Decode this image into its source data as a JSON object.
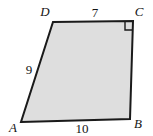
{
  "figure": {
    "type": "geometry-quadrilateral",
    "background_color": "#ffffff",
    "fill_color": "#dedede",
    "stroke_color": "#1a1a1a",
    "stroke_width": 2,
    "vertices": [
      {
        "name": "A",
        "label": "A",
        "x": 21,
        "y": 122,
        "label_x": 13,
        "label_y": 132
      },
      {
        "name": "B",
        "label": "B",
        "x": 130,
        "y": 119,
        "label_x": 138,
        "label_y": 128
      },
      {
        "name": "C",
        "label": "C",
        "x": 133,
        "y": 21,
        "label_x": 139,
        "label_y": 16
      },
      {
        "name": "D",
        "label": "D",
        "x": 53,
        "y": 22,
        "label_x": 45,
        "label_y": 16
      }
    ],
    "sides": [
      {
        "name": "side-dc",
        "from": "D",
        "to": "C",
        "label": "7",
        "label_x": 95,
        "label_y": 17
      },
      {
        "name": "side-ad",
        "from": "A",
        "to": "D",
        "label": "9",
        "label_x": 29,
        "label_y": 74
      },
      {
        "name": "side-ab",
        "from": "A",
        "to": "B",
        "label": "10",
        "label_x": 82,
        "label_y": 133
      },
      {
        "name": "side-bc",
        "from": "B",
        "to": "C",
        "label": "",
        "label_x": 0,
        "label_y": 0
      }
    ],
    "right_angle": {
      "at_vertex": "C",
      "marker": "right-angle-square",
      "size": 8
    }
  }
}
